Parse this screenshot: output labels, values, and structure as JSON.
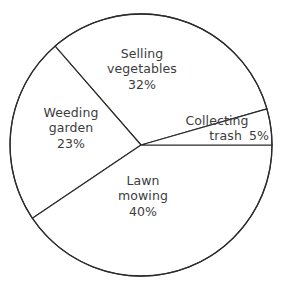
{
  "chart_data": {
    "type": "pie",
    "title": "",
    "subtitle": "",
    "xlabel": "",
    "ylabel": "",
    "legend": "none",
    "grid": false,
    "total_percent": 100,
    "value_suffix": "%",
    "categories": [
      "Selling vegetables",
      "Collecting trash",
      "Lawn mowing",
      "Weeding garden"
    ],
    "values": [
      32,
      5,
      40,
      23
    ],
    "slices": [
      {
        "id": "selling-vegetables",
        "label_line_1": "Selling",
        "label_line_2": "vegetables",
        "value": 32,
        "value_text": "32%",
        "start_angle_deg": -16,
        "end_angle_deg": -131,
        "fill": "#ffffff",
        "stroke": "#2b2b2b"
      },
      {
        "id": "weeding-garden",
        "label_line_1": "Weeding",
        "label_line_2": "garden",
        "value": 23,
        "value_text": "23%",
        "start_angle_deg": -131,
        "end_angle_deg": -214,
        "fill": "#ffffff",
        "stroke": "#2b2b2b"
      },
      {
        "id": "lawn-mowing",
        "label_line_1": "Lawn",
        "label_line_2": "mowing",
        "value": 40,
        "value_text": "40%",
        "start_angle_deg": -214,
        "end_angle_deg": -360,
        "fill": "#ffffff",
        "stroke": "#2b2b2b"
      },
      {
        "id": "collecting-trash",
        "label_line_1": "Collecting",
        "label_line_2": "trash",
        "value": 5,
        "value_text": "5%",
        "start_angle_deg": 0,
        "end_angle_deg": -16,
        "fill": "#ffffff",
        "stroke": "#2b2b2b"
      }
    ],
    "geometry": {
      "center_x": 141,
      "center_y": 145,
      "radius": 131
    },
    "colors": {
      "background": "#ffffff",
      "outline": "#2b2b2b",
      "text": "#3c3c3c"
    }
  }
}
